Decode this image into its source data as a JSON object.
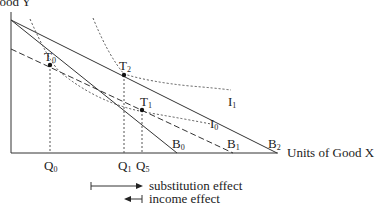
{
  "diagram": {
    "type": "indifference-curve / budget-line diagram",
    "y_axis_label": "Good Y",
    "x_axis_label": "Units of Good X",
    "budget_lines": [
      {
        "id": "B0",
        "label": "B",
        "sub": "0",
        "style": "solid"
      },
      {
        "id": "B1",
        "label": "B",
        "sub": "1",
        "style": "dashed"
      },
      {
        "id": "B2",
        "label": "B",
        "sub": "2",
        "style": "solid"
      }
    ],
    "indifference_curves": [
      {
        "id": "I0",
        "label": "I",
        "sub": "0",
        "style": "dotted"
      },
      {
        "id": "I1",
        "label": "I",
        "sub": "1",
        "style": "dotted"
      }
    ],
    "tangency_points": [
      {
        "id": "T0",
        "label": "T",
        "sub": "0"
      },
      {
        "id": "T1",
        "label": "T",
        "sub": "1"
      },
      {
        "id": "T2",
        "label": "T",
        "sub": "2"
      }
    ],
    "quantities": [
      {
        "id": "Q0",
        "label": "Q",
        "sub": "0"
      },
      {
        "id": "Q1",
        "label": "Q",
        "sub": "1"
      },
      {
        "id": "Q5",
        "label": "Q",
        "sub": "5"
      }
    ],
    "legend": {
      "substitution": "substitution effect",
      "income": "income effect"
    }
  }
}
